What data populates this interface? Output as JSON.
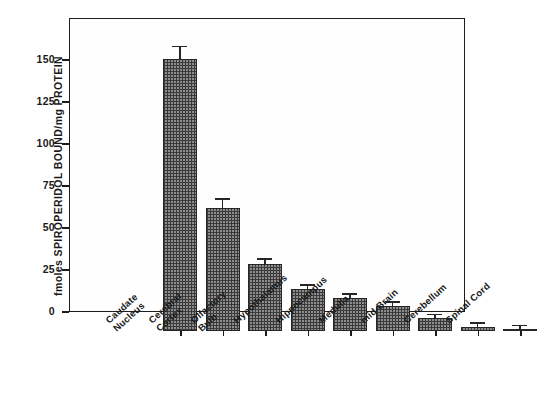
{
  "chart_data": {
    "type": "bar",
    "title": "",
    "xlabel": "",
    "ylabel": "fmoles SPIROPERIDOL BOUND/mg PROTEIN",
    "ylim": [
      0,
      175
    ],
    "yticks": [
      0,
      25,
      50,
      75,
      100,
      125,
      150
    ],
    "ytick_labels": [
      "0",
      "25",
      "50",
      "75",
      "100",
      "125",
      "150"
    ],
    "grid": false,
    "legend": "none",
    "categories": [
      "Caudate Nucleus",
      "Cerebral Cortex",
      "Olfactory Bulb",
      "Hypothalamus",
      "Hippocampus",
      "Medulla",
      "mid-Brain",
      "Cerebellum",
      "Spinal Cord"
    ],
    "category_lines": [
      [
        "Caudate",
        "Nucleus"
      ],
      [
        "Cerebral",
        "Cortex"
      ],
      [
        "Olfactory",
        "Bulb"
      ],
      [
        "Hypothalamus",
        ""
      ],
      [
        "Hippocampus",
        ""
      ],
      [
        "Medulla",
        ""
      ],
      [
        "mid-Brain",
        ""
      ],
      [
        "Cerebellum",
        ""
      ],
      [
        "Spinal Cord",
        ""
      ]
    ],
    "values": [
      162,
      73.5,
      40,
      25,
      19.5,
      15,
      7.5,
      2.5,
      1
    ],
    "errors": [
      7,
      4.5,
      2.5,
      2,
      2,
      1.5,
      1.5,
      0.8,
      0.4
    ],
    "bar_color": "#8d8d8d",
    "bar_pattern": "checkered-hatch",
    "bar_edge_color": "#262626",
    "axis_color": "#1c1c1c",
    "text_color": "#1a1a1a",
    "background": "#ffffff"
  }
}
